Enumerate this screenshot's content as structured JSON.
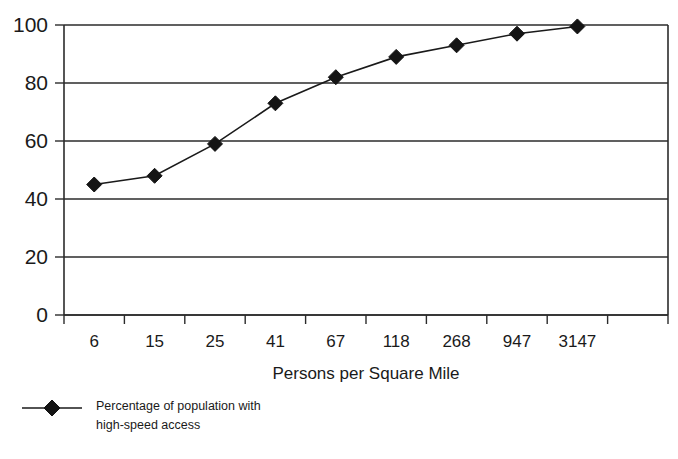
{
  "chart_data": {
    "type": "line",
    "title": "",
    "subtitle": "",
    "xlabel": "Persons per Square Mile",
    "ylabel": "",
    "categories": [
      "6",
      "15",
      "25",
      "41",
      "67",
      "118",
      "268",
      "947",
      "3147"
    ],
    "x_tick_labels": [
      "6",
      "15",
      "25",
      "41",
      "67",
      "118",
      "268",
      "947",
      "3147"
    ],
    "y_tick_labels": [
      "0",
      "20",
      "40",
      "60",
      "80",
      "100"
    ],
    "y_ticks": [
      0,
      20,
      40,
      60,
      80,
      100
    ],
    "ylim": [
      0,
      100
    ],
    "grid": "horizontal",
    "legend_position": "bottom-left",
    "series": [
      {
        "name": "Percentage of population with high-speed access",
        "name_line1": "Percentage of population with",
        "name_line2": "high-speed access",
        "marker": "diamond",
        "color": "#141414",
        "values": [
          45,
          48,
          59,
          73,
          82,
          89,
          93,
          97,
          99.5
        ]
      }
    ],
    "annotations": []
  },
  "legend": {
    "entries": [
      {
        "label_line1": "Percentage of population with",
        "label_line2": "high-speed access",
        "marker": "diamond"
      }
    ]
  },
  "axes": {
    "x_title": "Persons per Square Mile",
    "y_title": ""
  },
  "colors": {
    "ink": "#1a1a1a",
    "axis": "#2b2b2b",
    "marker": "#141414",
    "background": "#ffffff"
  }
}
